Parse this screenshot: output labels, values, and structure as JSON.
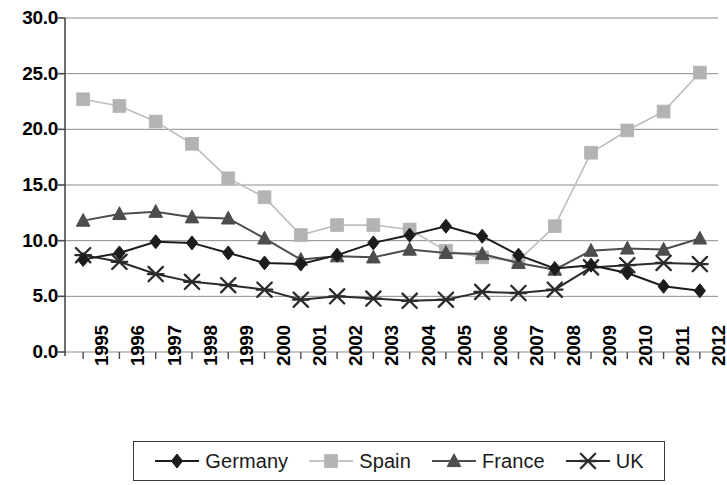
{
  "chart_data": {
    "type": "line",
    "title": "",
    "xlabel": "",
    "ylabel": "",
    "x": [
      1995,
      1996,
      1997,
      1998,
      1999,
      2000,
      2001,
      2002,
      2003,
      2004,
      2005,
      2006,
      2007,
      2008,
      2009,
      2010,
      2011,
      2012
    ],
    "categories": [
      "1995",
      "1996",
      "1997",
      "1998",
      "1999",
      "2000",
      "2001",
      "2002",
      "2003",
      "2004",
      "2005",
      "2006",
      "2007",
      "2008",
      "2009",
      "2010",
      "2011",
      "2012"
    ],
    "ylim": [
      0.0,
      30.0
    ],
    "yticks": [
      0.0,
      5.0,
      10.0,
      15.0,
      20.0,
      25.0,
      30.0
    ],
    "ytick_labels": [
      "0.0",
      "5.0",
      "10.0",
      "15.0",
      "20.0",
      "25.0",
      "30.0"
    ],
    "grid": true,
    "grid_axis": "y",
    "legend_position": "bottom",
    "series": [
      {
        "name": "Germany",
        "marker": "diamond",
        "color": "#1c1c1c",
        "line_color": "#1c1c1c",
        "values": [
          8.3,
          8.9,
          9.9,
          9.8,
          8.9,
          8.0,
          7.9,
          8.7,
          9.8,
          10.5,
          11.3,
          10.4,
          8.7,
          7.5,
          7.8,
          7.1,
          5.9,
          5.5
        ]
      },
      {
        "name": "Spain",
        "marker": "square",
        "color": "#b3b3b3",
        "line_color": "#bdbdbd",
        "values": [
          22.7,
          22.1,
          20.7,
          18.7,
          15.6,
          13.9,
          10.5,
          11.4,
          11.4,
          11.0,
          9.1,
          8.5,
          8.2,
          11.3,
          17.9,
          19.9,
          21.6,
          25.1
        ]
      },
      {
        "name": "France",
        "marker": "triangle",
        "color": "#4d4d4d",
        "line_color": "#4d4d4d",
        "values": [
          11.8,
          12.4,
          12.6,
          12.1,
          12.0,
          10.2,
          8.3,
          8.6,
          8.5,
          9.2,
          8.9,
          8.8,
          8.0,
          7.4,
          9.1,
          9.3,
          9.2,
          10.2
        ]
      },
      {
        "name": "UK",
        "marker": "cross-x",
        "color": "#2b2b2b",
        "line_color": "#2b2b2b",
        "values": [
          8.7,
          8.1,
          7.0,
          6.3,
          6.0,
          5.6,
          4.7,
          5.0,
          4.8,
          4.6,
          4.7,
          5.4,
          5.3,
          5.6,
          7.6,
          7.8,
          8.0,
          7.9
        ]
      }
    ]
  },
  "legend": {
    "items": [
      {
        "label": "Germany",
        "marker": "diamond",
        "color": "#1c1c1c"
      },
      {
        "label": "Spain",
        "marker": "square",
        "color": "#b3b3b3"
      },
      {
        "label": "France",
        "marker": "triangle",
        "color": "#4d4d4d"
      },
      {
        "label": "UK",
        "marker": "cross-x",
        "color": "#2b2b2b"
      }
    ]
  },
  "axes": {
    "y_tick_labels": [
      "30.0",
      "25.0",
      "20.0",
      "15.0",
      "10.0",
      "5.0",
      "0.0"
    ],
    "x_tick_labels": [
      "1995",
      "1996",
      "1997",
      "1998",
      "1999",
      "2000",
      "2001",
      "2002",
      "2003",
      "2004",
      "2005",
      "2006",
      "2007",
      "2008",
      "2009",
      "2010",
      "2011",
      "2012"
    ]
  }
}
